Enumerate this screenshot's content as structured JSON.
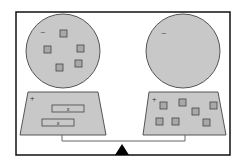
{
  "diagram": {
    "colors": {
      "fill": "#c8c8c8",
      "stroke": "#555555",
      "frame": "#111111",
      "tile_fill": "#a8a8a8"
    },
    "left_pan": {
      "circle_sign": "−",
      "circle_tiles": 5,
      "tray_sign": "+",
      "tray_items": [
        {
          "label": "x"
        },
        {
          "label": "x"
        }
      ]
    },
    "right_pan": {
      "circle_sign": "−",
      "circle_tiles": 0,
      "tray_sign": "+",
      "tray_tiles": 7
    },
    "fulcrum": "triangle"
  }
}
